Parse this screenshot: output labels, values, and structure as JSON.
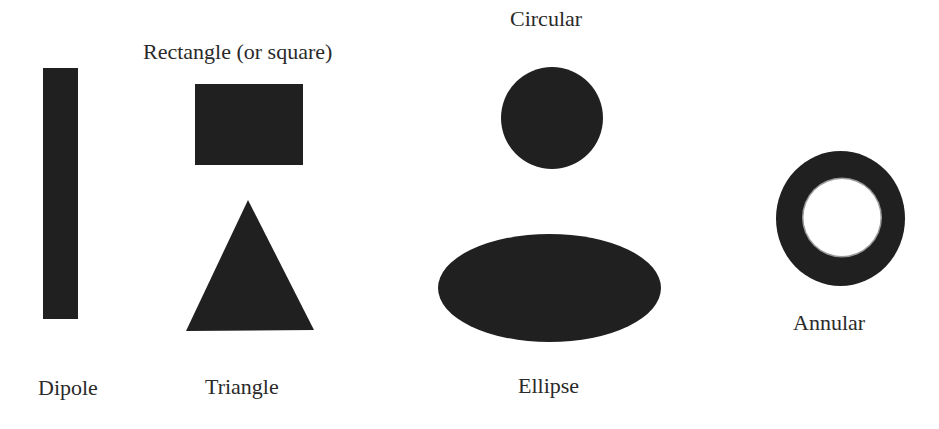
{
  "diagram": {
    "ink_color": "#202020",
    "background": "#ffffff",
    "shapes": [
      {
        "id": "dipole",
        "kind": "rect",
        "label": "Dipole"
      },
      {
        "id": "rectangle",
        "kind": "rect",
        "label": "Rectangle (or square)"
      },
      {
        "id": "triangle",
        "kind": "polygon",
        "label": "Triangle"
      },
      {
        "id": "circular",
        "kind": "circle",
        "label": "Circular"
      },
      {
        "id": "ellipse",
        "kind": "ellipse",
        "label": "Ellipse"
      },
      {
        "id": "annular",
        "kind": "annulus",
        "label": "Annular"
      }
    ]
  }
}
